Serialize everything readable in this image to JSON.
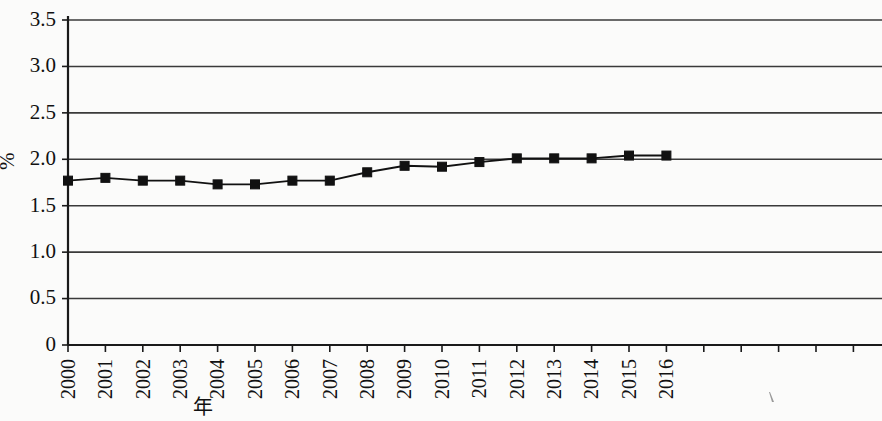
{
  "chart_data": {
    "type": "line",
    "title": "",
    "subtitle": "",
    "xlabel": "年",
    "ylabel": "%",
    "x": [
      2000,
      2001,
      2002,
      2003,
      2004,
      2005,
      2006,
      2007,
      2008,
      2009,
      2010,
      2011,
      2012,
      2013,
      2014,
      2015,
      2016
    ],
    "categories": [
      "2000",
      "2001",
      "2002",
      "2003",
      "2004",
      "2005",
      "2006",
      "2007",
      "2008",
      "2009",
      "2010",
      "2011",
      "2012",
      "2013",
      "2014",
      "2015",
      "2016"
    ],
    "values": [
      1.77,
      1.8,
      1.77,
      1.77,
      1.73,
      1.73,
      1.77,
      1.77,
      1.86,
      1.93,
      1.92,
      1.97,
      2.01,
      2.01,
      2.01,
      2.04,
      2.04
    ],
    "series": [
      {
        "name": "",
        "values": [
          1.77,
          1.8,
          1.77,
          1.77,
          1.73,
          1.73,
          1.77,
          1.77,
          1.86,
          1.93,
          1.92,
          1.97,
          2.01,
          2.01,
          2.01,
          2.04,
          2.04
        ],
        "color": "#111111",
        "marker": "square"
      }
    ],
    "ylim": [
      0,
      3.5
    ],
    "yticks": [
      0,
      0.5,
      1.0,
      1.5,
      2.0,
      2.5,
      3.0,
      3.5
    ],
    "ytick_labels": [
      "0",
      "0.5",
      "1.0",
      "1.5",
      "2.0",
      "2.5",
      "3.0",
      "3.5"
    ],
    "xlim": [
      2000,
      2021.6
    ],
    "grid": "horizontal",
    "legend": "none",
    "xtick_rotation": 90,
    "ylabel_rotation": 90,
    "extra_unlabeled_xticks": 5,
    "colors": {
      "background": "#fbfbfa",
      "gridline": "#3a3a3a",
      "axis": "#1a1a1a",
      "series": "#111111"
    }
  }
}
